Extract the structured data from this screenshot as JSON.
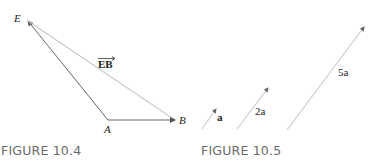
{
  "figures": [
    {
      "caption": "FIGURE 10.4",
      "points": {
        "E": "E",
        "A": "A",
        "B": "B"
      },
      "vector_label": "EB",
      "colors": {
        "primary": "#555555",
        "light": "#c8c8c8"
      }
    },
    {
      "caption": "FIGURE 10.5",
      "vectors": [
        {
          "label": "a"
        },
        {
          "label": "2a"
        },
        {
          "label": "5a"
        }
      ],
      "colors": {
        "line": "#c8c8c8",
        "head": "#555555"
      }
    }
  ]
}
